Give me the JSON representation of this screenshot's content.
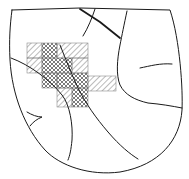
{
  "map": {
    "colors": {
      "background": "#ffffff",
      "line": "#1a1a1a",
      "hatch": "#555555"
    },
    "hatched_cells": [
      {
        "x": 27,
        "y": 43,
        "w": 15,
        "h": 15,
        "pattern": "single"
      },
      {
        "x": 42,
        "y": 43,
        "w": 15,
        "h": 15,
        "pattern": "cross"
      },
      {
        "x": 57,
        "y": 43,
        "w": 31,
        "h": 15,
        "pattern": "single"
      },
      {
        "x": 27,
        "y": 58,
        "w": 15,
        "h": 15,
        "pattern": "single"
      },
      {
        "x": 42,
        "y": 58,
        "w": 30,
        "h": 15,
        "pattern": "cross"
      },
      {
        "x": 72,
        "y": 58,
        "w": 16,
        "h": 15,
        "pattern": "single"
      },
      {
        "x": 42,
        "y": 73,
        "w": 15,
        "h": 15,
        "pattern": "cross"
      },
      {
        "x": 57,
        "y": 73,
        "w": 31,
        "h": 15,
        "pattern": "cross"
      },
      {
        "x": 88,
        "y": 76,
        "w": 28,
        "h": 15,
        "pattern": "single"
      },
      {
        "x": 57,
        "y": 88,
        "w": 15,
        "h": 19,
        "pattern": "single"
      },
      {
        "x": 72,
        "y": 88,
        "w": 16,
        "h": 19,
        "pattern": "cross"
      }
    ]
  }
}
